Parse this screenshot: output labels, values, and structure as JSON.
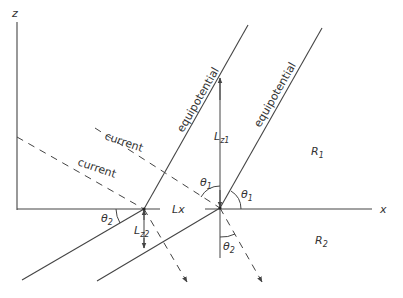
{
  "axes": {
    "z_label": "z",
    "x_label": "x"
  },
  "labels": {
    "equipotential_left": "equipotential",
    "equipotential_right": "equipotential",
    "current_upper": "current",
    "current_lower": "current",
    "lx": "Lx",
    "lz1_main": "L",
    "lz1_sub": "z1",
    "lz2_main": "L",
    "lz2_sub": "z2",
    "theta1_a_main": "θ",
    "theta1_a_sub": "1",
    "theta1_b_main": "θ",
    "theta1_b_sub": "1",
    "theta2_a_main": "θ",
    "theta2_a_sub": "2",
    "theta2_b_main": "θ",
    "theta2_b_sub": "2",
    "r1_main": "R",
    "r1_sub": "1",
    "r2_main": "R",
    "r2_sub": "2"
  },
  "colors": {
    "line": "#444444",
    "text": "#333333",
    "background": "#ffffff"
  }
}
